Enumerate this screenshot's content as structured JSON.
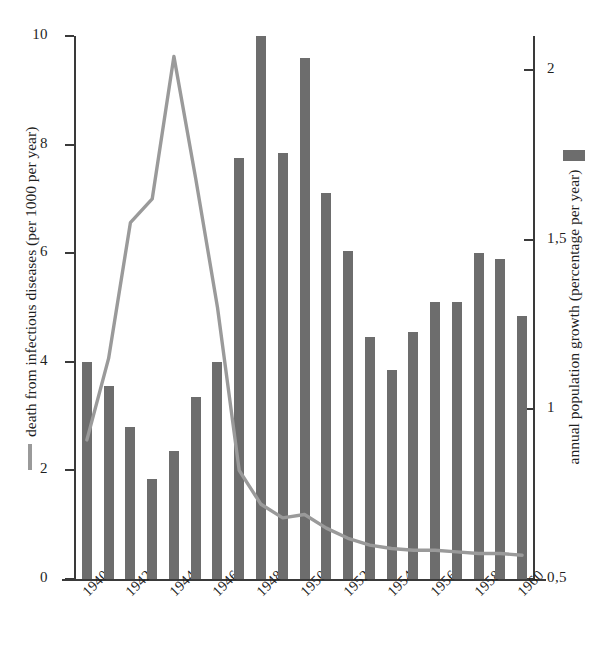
{
  "chart_data": {
    "type": "bar",
    "title": "",
    "subtitle": "",
    "xlabel": "",
    "ylabel": "death from infectious diseases (per 1000 per year)",
    "y2label": "annual population growth (percentage per year)",
    "grid": false,
    "legend_position": "axis-titles",
    "x": [
      1940,
      1941,
      1942,
      1943,
      1944,
      1945,
      1946,
      1947,
      1948,
      1949,
      1950,
      1951,
      1952,
      1953,
      1954,
      1955,
      1956,
      1957,
      1958,
      1959,
      1960
    ],
    "x_tick_labels": [
      "1940",
      "1942",
      "1944",
      "1946",
      "1948",
      "1950",
      "1952",
      "1954",
      "1956",
      "1958",
      "1960"
    ],
    "x_tick_values": [
      1940,
      1942,
      1944,
      1946,
      1948,
      1950,
      1952,
      1954,
      1956,
      1958,
      1960
    ],
    "ylim": [
      0,
      10
    ],
    "y_tick_labels": [
      "0",
      "2",
      "4",
      "6",
      "8",
      "10"
    ],
    "y_tick_values": [
      0,
      2,
      4,
      6,
      8,
      10
    ],
    "y2lim": [
      0.5,
      2.1
    ],
    "y2_tick_labels": [
      "0,5",
      "1",
      "1,5",
      "2"
    ],
    "y2_tick_values": [
      0.5,
      1.0,
      1.5,
      2.0
    ],
    "series": [
      {
        "name": "death from infectious diseases (per 1000 per year)",
        "type": "bar",
        "axis": "left",
        "color": "#6d6d6d",
        "values": [
          4.0,
          3.55,
          2.8,
          1.85,
          2.35,
          3.35,
          4.0,
          7.75,
          10.0,
          7.85,
          9.6,
          7.1,
          6.05,
          4.45,
          3.85,
          4.55,
          5.1,
          5.1,
          6.0,
          5.9,
          4.85
        ]
      },
      {
        "name": "annual population growth (percentage per year)",
        "type": "line",
        "axis": "right",
        "color": "#9a9a9a",
        "values": [
          0.91,
          1.15,
          1.55,
          1.62,
          2.04,
          1.68,
          1.3,
          0.82,
          0.72,
          0.68,
          0.69,
          0.65,
          0.62,
          0.6,
          0.59,
          0.585,
          0.585,
          0.58,
          0.575,
          0.575,
          0.57
        ]
      }
    ]
  },
  "legend": {
    "line_marker": "line-swatch",
    "bar_marker": "bar-swatch"
  },
  "icons": {
    "line_swatch": "horizontal-line-icon",
    "bar_swatch": "vertical-bar-icon"
  }
}
